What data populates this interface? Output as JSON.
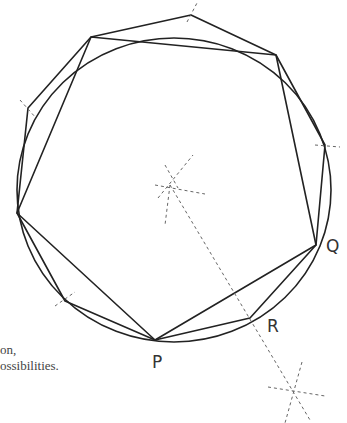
{
  "diagram": {
    "labels": {
      "P": "P",
      "Q": "Q",
      "R": "R"
    },
    "caption": {
      "line1": "on,",
      "line2": "ossibilities."
    },
    "colors": {
      "line": "#222222",
      "construction": "#666666",
      "text": "#333333"
    }
  }
}
